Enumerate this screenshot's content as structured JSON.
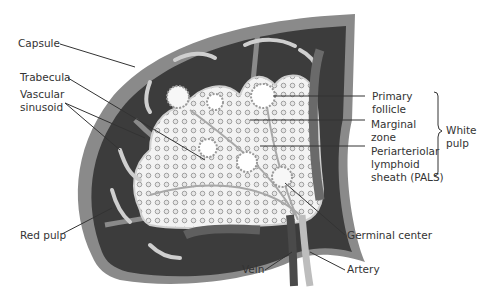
{
  "diagram": {
    "labels": {
      "capsule": "Capsule",
      "trabecula": "Trabecula",
      "vascular_sinusoid_line1": "Vascular",
      "vascular_sinusoid_line2": "sinusoid",
      "red_pulp": "Red pulp",
      "primary_follicle_line1": "Primary",
      "primary_follicle_line2": "follicle",
      "marginal_zone_line1": "Marginal",
      "marginal_zone_line2": "zone",
      "pals_line1": "Periarteriolar",
      "pals_line2": "lymphoid",
      "pals_line3": "sheath (PALS)",
      "white_pulp_line1": "White",
      "white_pulp_line2": "pulp",
      "germinal_center": "Germinal center",
      "vein": "Vein",
      "artery": "Artery"
    },
    "colors": {
      "capsule": "#8a8a8a",
      "red_pulp": "#3a3a3a",
      "white_pulp": "#f2f2f2",
      "marginal": "#d8d8d8",
      "vessel": "#b8b8b8",
      "leader": "#333333",
      "text": "#333333"
    }
  }
}
